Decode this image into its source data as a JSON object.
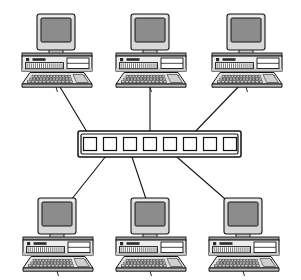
{
  "diagram": {
    "type": "network-topology",
    "background_color": "#ffffff",
    "line_color": "#1a1a1a",
    "canvas": {
      "width": 301,
      "height": 280
    },
    "hub": {
      "label": "network-hub",
      "kind": "ethernet-hub",
      "port_count": 8,
      "x": 78,
      "y": 131,
      "width": 163,
      "height": 26,
      "ports": [
        {
          "index": 1,
          "cx": 90,
          "cy": 144,
          "connected": true,
          "connected_to": "pc-top-left"
        },
        {
          "index": 2,
          "cx": 110,
          "cy": 144,
          "connected": true,
          "connected_to": "pc-bottom-left"
        },
        {
          "index": 3,
          "cx": 130,
          "cy": 144,
          "connected": true,
          "connected_to": "pc-bottom-middle"
        },
        {
          "index": 4,
          "cx": 150,
          "cy": 144,
          "connected": true,
          "connected_to": "pc-top-middle"
        },
        {
          "index": 5,
          "cx": 170,
          "cy": 144,
          "connected": true,
          "connected_to": "pc-bottom-right"
        },
        {
          "index": 6,
          "cx": 190,
          "cy": 144,
          "connected": true,
          "connected_to": "pc-top-right"
        },
        {
          "index": 7,
          "cx": 210,
          "cy": 144,
          "connected": false,
          "connected_to": null
        },
        {
          "index": 8,
          "cx": 230,
          "cy": 144,
          "connected": false,
          "connected_to": null
        }
      ]
    },
    "computers": [
      {
        "id": "pc-top-left",
        "label": "Computer 1",
        "row": "top",
        "cx": 56,
        "cy": 14,
        "scale": 1.0
      },
      {
        "id": "pc-top-middle",
        "label": "Computer 2",
        "row": "top",
        "cx": 150,
        "cy": 14,
        "scale": 1.0
      },
      {
        "id": "pc-top-right",
        "label": "Computer 3",
        "row": "top",
        "cx": 246,
        "cy": 14,
        "scale": 1.0
      },
      {
        "id": "pc-bottom-left",
        "label": "Computer 4",
        "row": "bottom",
        "cx": 57,
        "cy": 200,
        "scale": 1.0
      },
      {
        "id": "pc-bottom-middle",
        "label": "Computer 5",
        "row": "bottom",
        "cx": 150,
        "cy": 200,
        "scale": 1.0
      },
      {
        "id": "pc-bottom-right",
        "label": "Computer 6",
        "row": "bottom",
        "cx": 243,
        "cy": 200,
        "scale": 1.0
      }
    ],
    "links": [
      {
        "id": "link-top-left",
        "from": "pc-top-left",
        "to_port": 1,
        "x1": 57,
        "y1": 82,
        "x2": 90,
        "y2": 137
      },
      {
        "id": "link-top-middle",
        "from": "pc-top-middle",
        "to_port": 4,
        "x1": 150,
        "y1": 82,
        "x2": 150,
        "y2": 137
      },
      {
        "id": "link-top-right",
        "from": "pc-top-right",
        "to_port": 6,
        "x1": 243,
        "y1": 82,
        "x2": 190,
        "y2": 137
      },
      {
        "id": "link-bottom-left",
        "from": "pc-bottom-left",
        "to_port": 2,
        "x1": 110,
        "y1": 151,
        "x2": 67,
        "y2": 205
      },
      {
        "id": "link-bottom-middle",
        "from": "pc-bottom-middle",
        "to_port": 3,
        "x1": 130,
        "y1": 151,
        "x2": 148,
        "y2": 205
      },
      {
        "id": "link-bottom-right",
        "from": "pc-bottom-right",
        "to_port": 5,
        "x1": 170,
        "y1": 151,
        "x2": 232,
        "y2": 205
      }
    ]
  }
}
